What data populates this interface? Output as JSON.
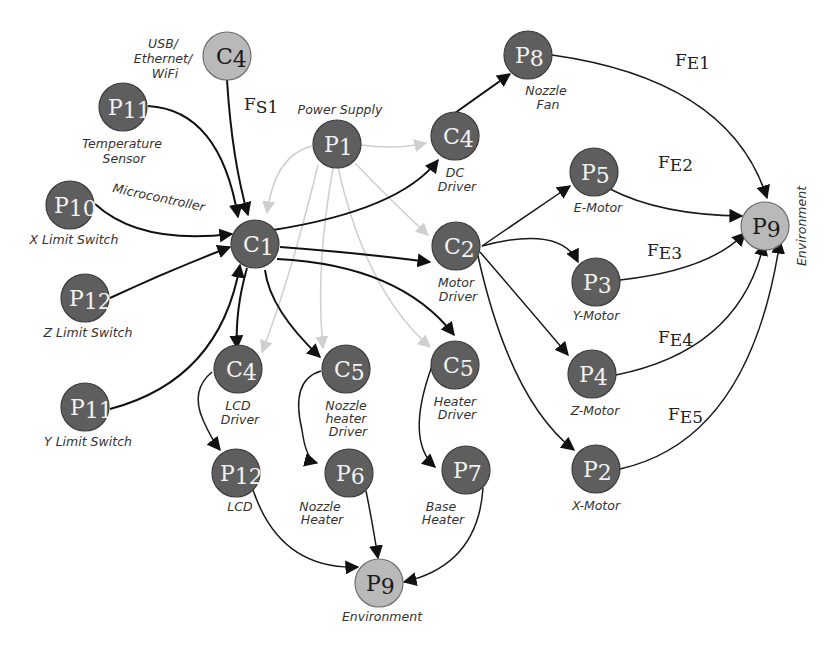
{
  "diagram": {
    "colors": {
      "node_dark": "#5e5e5e",
      "node_light": "#b9b9b9",
      "edge_dark": "#111111",
      "edge_power": "#cfcfcf"
    },
    "nodes": {
      "c4_usb": {
        "sym": "C",
        "sub": "4",
        "caption": [
          "USB/",
          "Ethernet/",
          "WiFi"
        ]
      },
      "p11_temp": {
        "sym": "P",
        "sub": "11",
        "caption": [
          "Temperature",
          "Sensor"
        ]
      },
      "p10_x": {
        "sym": "P",
        "sub": "10",
        "caption": [
          "X Limit Switch"
        ]
      },
      "p12_z": {
        "sym": "P",
        "sub": "12",
        "caption": [
          "Z Limit Switch"
        ]
      },
      "p11_y": {
        "sym": "P",
        "sub": "11",
        "caption": [
          "Y Limit Switch"
        ]
      },
      "c1": {
        "sym": "C",
        "sub": "1",
        "caption": [
          "Microcontroller"
        ]
      },
      "p1": {
        "sym": "P",
        "sub": "1",
        "caption": [
          "Power Supply"
        ]
      },
      "c4_dc": {
        "sym": "C",
        "sub": "4",
        "caption": [
          "DC",
          "Driver"
        ]
      },
      "p8": {
        "sym": "P",
        "sub": "8",
        "caption": [
          "Nozzle",
          "Fan"
        ]
      },
      "c2": {
        "sym": "C",
        "sub": "2",
        "caption": [
          "Motor",
          "Driver"
        ]
      },
      "p5": {
        "sym": "P",
        "sub": "5",
        "caption": [
          "E-Motor"
        ]
      },
      "p3": {
        "sym": "P",
        "sub": "3",
        "caption": [
          "Y-Motor"
        ]
      },
      "p4": {
        "sym": "P",
        "sub": "4",
        "caption": [
          "Z-Motor"
        ]
      },
      "p2": {
        "sym": "P",
        "sub": "2",
        "caption": [
          "X-Motor"
        ]
      },
      "p9_right": {
        "sym": "P",
        "sub": "9",
        "caption": [
          "Environment"
        ]
      },
      "c4_lcd": {
        "sym": "C",
        "sub": "4",
        "caption": [
          "LCD",
          "Driver"
        ]
      },
      "c5_nozzle": {
        "sym": "C",
        "sub": "5",
        "caption": [
          "Nozzle",
          "heater",
          "Driver"
        ]
      },
      "c5_heater": {
        "sym": "C",
        "sub": "5",
        "caption": [
          "Heater",
          "Driver"
        ]
      },
      "p12_lcd": {
        "sym": "P",
        "sub": "12",
        "caption": [
          "LCD"
        ]
      },
      "p6": {
        "sym": "P",
        "sub": "6",
        "caption": [
          "Nozzle",
          "Heater"
        ]
      },
      "p7": {
        "sym": "P",
        "sub": "7",
        "caption": [
          "Base",
          "Heater"
        ]
      },
      "p9_bottom": {
        "sym": "P",
        "sub": "9",
        "caption": [
          "Environment"
        ]
      }
    },
    "flow_labels": {
      "fs1": {
        "main": "F",
        "sub": "S1"
      },
      "fe1": {
        "main": "F",
        "sub": "E1"
      },
      "fe2": {
        "main": "F",
        "sub": "E2"
      },
      "fe3": {
        "main": "F",
        "sub": "E3"
      },
      "fe4": {
        "main": "F",
        "sub": "E4"
      },
      "fe5": {
        "main": "F",
        "sub": "E5"
      }
    },
    "edges": [
      {
        "from": "C4 (USB/Ethernet/WiFi)",
        "to": "C1",
        "label": "FS1",
        "type": "signal"
      },
      {
        "from": "P11 (Temperature Sensor)",
        "to": "C1",
        "type": "signal"
      },
      {
        "from": "P10 (X Limit Switch)",
        "to": "C1",
        "type": "signal"
      },
      {
        "from": "P12 (Z Limit Switch)",
        "to": "C1",
        "type": "signal"
      },
      {
        "from": "P11 (Y Limit Switch)",
        "to": "C1",
        "type": "signal"
      },
      {
        "from": "C1",
        "to": "C4 (DC Driver)",
        "type": "signal"
      },
      {
        "from": "C1",
        "to": "C2 (Motor Driver)",
        "type": "signal"
      },
      {
        "from": "C1",
        "to": "C5 (Heater Driver)",
        "type": "signal"
      },
      {
        "from": "C1",
        "to": "C4 (LCD Driver)",
        "type": "signal"
      },
      {
        "from": "C1",
        "to": "C5 (Nozzle heater Driver)",
        "type": "signal"
      },
      {
        "from": "P1",
        "to": "C4 (DC Driver)",
        "type": "power"
      },
      {
        "from": "P1",
        "to": "C1",
        "type": "power"
      },
      {
        "from": "P1",
        "to": "C2 (Motor Driver)",
        "type": "power"
      },
      {
        "from": "P1",
        "to": "C4 (LCD Driver)",
        "type": "power"
      },
      {
        "from": "P1",
        "to": "C5 (Nozzle heater Driver)",
        "type": "power"
      },
      {
        "from": "P1",
        "to": "C5 (Heater Driver)",
        "type": "power"
      },
      {
        "from": "C4 (DC Driver)",
        "to": "P8 (Nozzle Fan)",
        "type": "signal"
      },
      {
        "from": "C2",
        "to": "P5 (E-Motor)",
        "type": "signal"
      },
      {
        "from": "C2",
        "to": "P3 (Y-Motor)",
        "type": "signal"
      },
      {
        "from": "C2",
        "to": "P4 (Z-Motor)",
        "type": "signal"
      },
      {
        "from": "C2",
        "to": "P2 (X-Motor)",
        "type": "signal"
      },
      {
        "from": "P8",
        "to": "P9 (Environment)",
        "label": "FE1",
        "type": "energy"
      },
      {
        "from": "P5",
        "to": "P9 (Environment)",
        "label": "FE2",
        "type": "energy"
      },
      {
        "from": "P3",
        "to": "P9 (Environment)",
        "label": "FE3",
        "type": "energy"
      },
      {
        "from": "P4",
        "to": "P9 (Environment)",
        "label": "FE4",
        "type": "energy"
      },
      {
        "from": "P2",
        "to": "P9 (Environment)",
        "label": "FE5",
        "type": "energy"
      },
      {
        "from": "C4 (LCD Driver)",
        "to": "P12 (LCD)",
        "type": "signal"
      },
      {
        "from": "C5 (Nozzle heater Driver)",
        "to": "P6 (Nozzle Heater)",
        "type": "signal"
      },
      {
        "from": "C5 (Heater Driver)",
        "to": "P7 (Base Heater)",
        "type": "signal"
      },
      {
        "from": "P12 (LCD)",
        "to": "P9 (Environment)",
        "type": "energy"
      },
      {
        "from": "P6 (Nozzle Heater)",
        "to": "P9 (Environment)",
        "type": "energy"
      },
      {
        "from": "P7 (Base Heater)",
        "to": "P9 (Environment)",
        "type": "energy"
      }
    ]
  }
}
